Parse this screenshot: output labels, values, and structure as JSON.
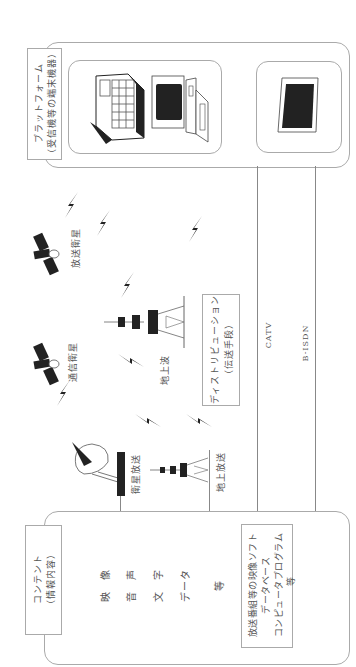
{
  "diagram": {
    "orientation": "rotated-90-ccw",
    "platform": {
      "title": "プラットフォーム",
      "subtitle": "（受信機等の端末機器）",
      "devices": [
        "laptop-terminal",
        "desktop-pc",
        "television"
      ]
    },
    "distribution": {
      "title": "ディストリビューション",
      "subtitle": "（伝送手段）"
    },
    "contents": {
      "title": "コンテント",
      "subtitle": "（情報内容）",
      "items": [
        "映　像",
        "音　声",
        "文　字",
        "データ",
        "等"
      ],
      "software_box": {
        "lines": [
          "放送番組等の映像ソフト",
          "データベース",
          "コンピュータプログラム",
          "等"
        ]
      }
    },
    "labels": {
      "broadcast_satellite": "放送衛星",
      "communication_satellite": "通信衛星",
      "terrestrial_wave": "地上波",
      "satellite_broadcast": "衛星放送",
      "terrestrial_broadcast": "地上放送",
      "catv": "CATV",
      "bisdn": "B-ISDN"
    },
    "colors": {
      "line": "#888888",
      "box_border": "#aaaaaa",
      "icon_fill": "#222222",
      "text": "#555555"
    }
  }
}
